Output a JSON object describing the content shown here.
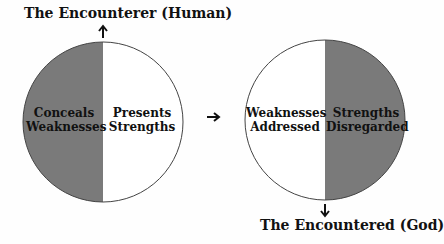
{
  "diagram": {
    "top_label": "The Encounterer (Human)",
    "bottom_label": "The Encountered (God)",
    "left_circle": {
      "left_half": {
        "line1": "Conceals",
        "line2": "Weaknesses",
        "fill": "#7a7a7a"
      },
      "right_half": {
        "line1": "Presents",
        "line2": "Strengths",
        "fill": "#ffffff"
      }
    },
    "right_circle": {
      "left_half": {
        "line1": "Weaknesses",
        "line2": "Addressed",
        "fill": "#ffffff"
      },
      "right_half": {
        "line1": "Strengths",
        "line2": "Disregarded",
        "fill": "#7a7a7a"
      }
    },
    "arrows": {
      "top": "up-arrow",
      "middle": "right-arrow",
      "bottom": "down-arrow"
    }
  }
}
